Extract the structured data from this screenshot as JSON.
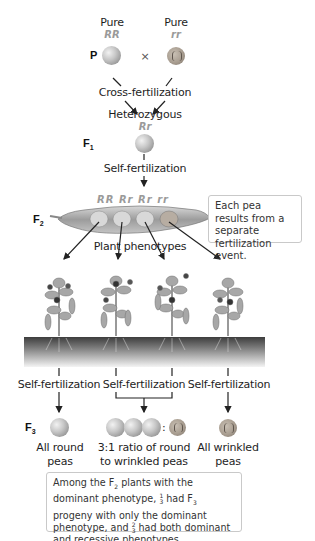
{
  "parental": {
    "generation_label": "P",
    "left": {
      "purity": "Pure",
      "genotype": "RR",
      "phenotype_icon": "round-pea-icon"
    },
    "cross_symbol": "×",
    "right": {
      "purity": "Pure",
      "genotype": "rr",
      "phenotype_icon": "wrinkled-pea-icon"
    },
    "process": "Cross-fertilization"
  },
  "f1": {
    "generation_label": "F",
    "generation_sub": "1",
    "description": "Heterozygous",
    "genotype": "Rr",
    "process": "Self-fertilization"
  },
  "f2": {
    "generation_label": "F",
    "generation_sub": "2",
    "genotypes": [
      "RR",
      "Rr",
      "Rr",
      "rr"
    ],
    "caption": "Plant phenotypes",
    "note": "Each pea results from a separate fertilization event."
  },
  "plants": [
    {
      "process": "Self-fertilization"
    },
    {
      "process": "Self-fertilization"
    },
    {
      "process": "Self-fertilization"
    }
  ],
  "f3": {
    "generation_label": "F",
    "generation_sub": "3",
    "outcomes": [
      {
        "line1": "All round",
        "line2": "peas"
      },
      {
        "line1": "3:1 ratio of round",
        "line2": "to wrinkled peas",
        "ratio_separator": ":"
      },
      {
        "line1": "All wrinkled",
        "line2": "peas"
      }
    ]
  },
  "summary": {
    "part1": "Among the F",
    "part1_sub": "2",
    "part2": " plants with the dominant phenotype, ",
    "frac1_num": "1",
    "frac1_den": "3",
    "part3": " had F",
    "part3_sub": "3",
    "part4": " progeny with only the dominant phenotype, and ",
    "frac2_num": "2",
    "frac2_den": "3",
    "part5": " had both dominant and recessive phenotypes."
  },
  "colors": {
    "genotype_text": "#9a9a9a",
    "soil_dark": "#4a4a4a",
    "note_border": "#c9c9c9"
  }
}
